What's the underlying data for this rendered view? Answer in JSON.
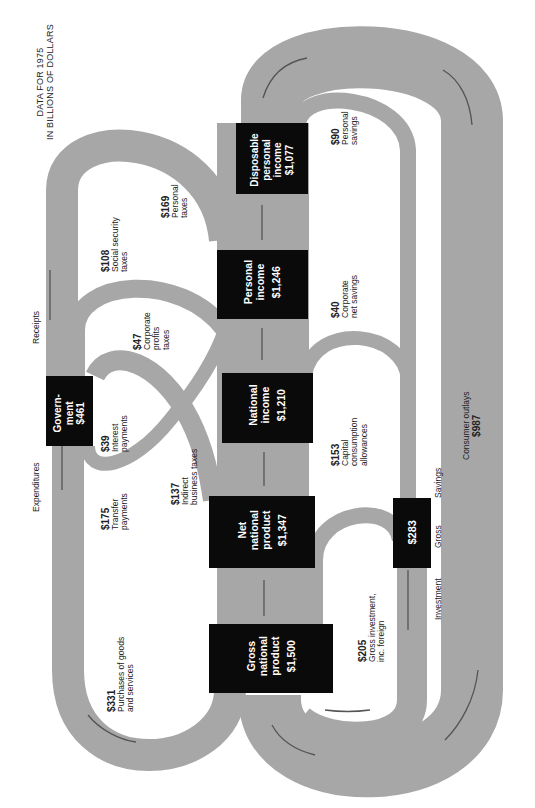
{
  "title": {
    "line1": "DATA FOR 1975",
    "line2": "IN BILLIONS OF DOLLARS"
  },
  "colors": {
    "band": "#a7a7a7",
    "box": "#0a0a0a",
    "box_text": "#ffffff",
    "arrow": "#555555"
  },
  "nodes": {
    "gnp": {
      "label": "Gross national product",
      "l1": "Gross",
      "l2": "national",
      "l3": "product",
      "value": "$1,500"
    },
    "nnp": {
      "label": "Net national product",
      "l1": "Net",
      "l2": "national",
      "l3": "product",
      "value": "$1,347"
    },
    "ni": {
      "label": "National income",
      "l1": "National",
      "l2": "income",
      "value": "$1,210"
    },
    "pi": {
      "label": "Personal income",
      "l1": "Personal",
      "l2": "income",
      "value": "$1,246"
    },
    "dpi": {
      "label": "Disposable personal income",
      "l1": "Disposable",
      "l2": "personal",
      "l3": "income",
      "value": "$1,077"
    },
    "gov": {
      "label": "Government",
      "l1": "Govern-",
      "l2": "ment",
      "value": "$461"
    },
    "gross_savings": {
      "value": "$283"
    }
  },
  "flows": {
    "purchases": {
      "value": "$331",
      "l1": "Purchases of goods",
      "l2": "and services"
    },
    "transfer": {
      "value": "$175",
      "l1": "Transfer",
      "l2": "payments"
    },
    "interest": {
      "value": "$39",
      "l1": "Interest",
      "l2": "payments"
    },
    "indirect": {
      "value": "$137",
      "l1": "Indirect",
      "l2": "business taxes"
    },
    "corp_profits": {
      "value": "$47",
      "l1": "Corporate",
      "l2": "profits",
      "l3": "taxes"
    },
    "social_sec": {
      "value": "$108",
      "l1": "Social security",
      "l2": "taxes"
    },
    "personal_taxes": {
      "value": "$169",
      "l1": "Personal",
      "l2": "taxes"
    },
    "personal_savings": {
      "value": "$90",
      "l1": "Personal",
      "l2": "savings"
    },
    "corp_savings": {
      "value": "$40",
      "l1": "Corporate",
      "l2": "net savings"
    },
    "cca": {
      "value": "$153",
      "l1": "Capital",
      "l2": "consumption",
      "l3": "allowances"
    },
    "gross_inv": {
      "value": "$205",
      "l1": "Gross investment,",
      "l2": "inc. foreign"
    },
    "consumer": {
      "label": "Consumer outlays",
      "value": "$987"
    }
  },
  "axis_labels": {
    "receipts": "Receipts",
    "expenditures": "Expenditures",
    "investment": "Investment",
    "gross": "Gross",
    "savings": "Savings"
  }
}
